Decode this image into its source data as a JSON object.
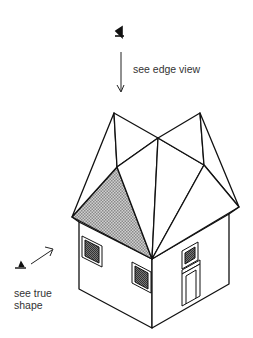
{
  "labels": {
    "top": "see edge view",
    "side_line1": "see true",
    "side_line2": "shape"
  },
  "icons": {
    "top_viewer": "eye-icon",
    "side_viewer": "eye-icon"
  },
  "colors": {
    "line": "#111111",
    "shade": "#b5b5b5",
    "window_fill": "#555555"
  }
}
